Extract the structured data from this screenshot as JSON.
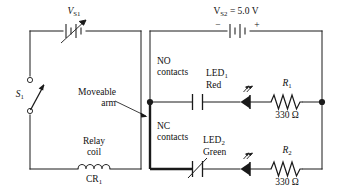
{
  "left_loop": {
    "source_label": "V",
    "source_sub": "S1",
    "source_type": "variable-dc-source",
    "switch_label": "S",
    "switch_sub": "1",
    "switch_state": "open",
    "coil_label_line1": "Relay",
    "coil_label_line2": "coil",
    "coil_designator": "CR",
    "coil_designator_sub": "1",
    "annotation_line1": "Moveable",
    "annotation_line2": "arm"
  },
  "right_loop": {
    "source_text": "= 5.0 V",
    "source_label": "V",
    "source_sub": "S2",
    "polarity_minus": "−",
    "polarity_plus": "+",
    "contacts_no_line1": "NO",
    "contacts_no_line2": "contacts",
    "contacts_nc_line1": "NC",
    "contacts_nc_line2": "contacts",
    "branches": [
      {
        "led_label": "LED",
        "led_sub": "1",
        "led_color_text": "Red",
        "resistor_label": "R",
        "resistor_sub": "1",
        "resistor_value": "330 Ω"
      },
      {
        "led_label": "LED",
        "led_sub": "2",
        "led_color_text": "Green",
        "resistor_label": "R",
        "resistor_sub": "2",
        "resistor_value": "330 Ω"
      }
    ]
  },
  "colors": {
    "wire": "#1a1a1a",
    "bold_wire": "#1a1a1a",
    "text": "#111111",
    "background": "#ffffff"
  }
}
